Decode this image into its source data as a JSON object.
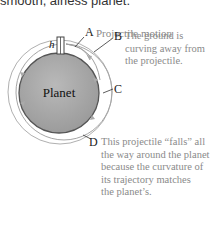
{
  "header": {
    "text": "smooth, airless planet."
  },
  "diagram": {
    "planet_label": "Planet",
    "height_label": "h",
    "colors": {
      "planet": "#a8a8a8",
      "orbit": "#9a9a9a",
      "text_gray": "#8a8a8a"
    },
    "callouts": [
      {
        "letter": "A",
        "text": "Projectile motion"
      },
      {
        "letter": "B",
        "text_lines": [
          "The ground is",
          "curving away from",
          "the projectile."
        ]
      },
      {
        "letter": "C",
        "text": ""
      },
      {
        "letter": "D",
        "text_lines": [
          "This projectile “falls” all",
          "the way around the planet",
          "because the curvature of",
          "its trajectory matches",
          "the planet’s."
        ]
      }
    ]
  }
}
